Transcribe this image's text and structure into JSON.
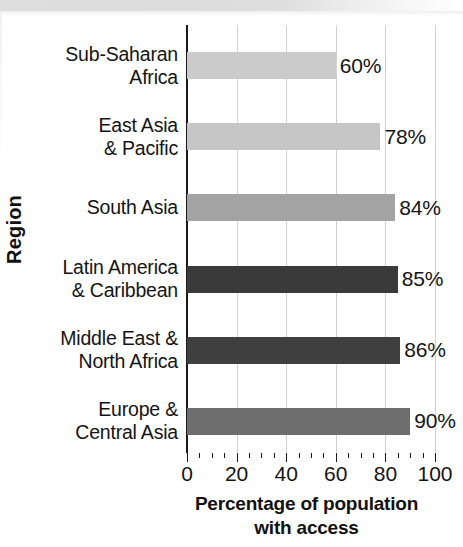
{
  "chart_data": {
    "type": "bar",
    "orientation": "horizontal",
    "title": "",
    "xlabel": "Percentage of population with access",
    "xlabel_lines": [
      "Percentage of population",
      "with access"
    ],
    "ylabel": "Region",
    "xlim": [
      0,
      100
    ],
    "xticks": [
      0,
      20,
      40,
      60,
      80,
      100
    ],
    "xticklabels": [
      "0",
      "20",
      "40",
      "60",
      "80",
      "100"
    ],
    "minor_tick_step": 5,
    "grid": "vertical",
    "legend": "none",
    "categories": [
      "Sub-Saharan Africa",
      "East Asia & Pacific",
      "South Asia",
      "Latin America & Caribbean",
      "Middle East & North Africa",
      "Europe & Central Asia"
    ],
    "values": [
      60,
      78,
      84,
      85,
      86,
      90
    ],
    "data_labels": [
      "60%",
      "78%",
      "84%",
      "85%",
      "86%",
      "90%"
    ],
    "bars": [
      {
        "category": "Sub-Saharan Africa",
        "label_lines": [
          "Sub-Saharan",
          "Africa"
        ],
        "value": 60,
        "data_label": "60%",
        "color": "#cbcbcb"
      },
      {
        "category": "East Asia & Pacific",
        "label_lines": [
          "East Asia",
          "& Pacific"
        ],
        "value": 78,
        "data_label": "78%",
        "color": "#c6c6c6"
      },
      {
        "category": "South Asia",
        "label_lines": [
          "South Asia"
        ],
        "value": 84,
        "data_label": "84%",
        "color": "#a3a3a3"
      },
      {
        "category": "Latin America & Caribbean",
        "label_lines": [
          "Latin America",
          "& Caribbean"
        ],
        "value": 85,
        "data_label": "85%",
        "color": "#3a3a3a"
      },
      {
        "category": "Middle East & North Africa",
        "label_lines": [
          "Middle East &",
          "North Africa"
        ],
        "value": 86,
        "data_label": "86%",
        "color": "#3f3f3f"
      },
      {
        "category": "Europe & Central Asia",
        "label_lines": [
          "Europe &",
          "Central Asia"
        ],
        "value": 90,
        "data_label": "90%",
        "color": "#6e6e6e"
      }
    ],
    "colors": {
      "axis": "#1a1a1a",
      "gridline": "#d2d2d2",
      "text": "#141414",
      "background": "#ffffff"
    }
  }
}
